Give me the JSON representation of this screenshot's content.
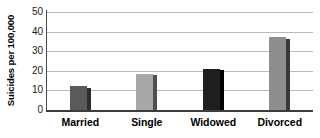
{
  "chart_data": {
    "type": "bar",
    "title": "",
    "xlabel": "",
    "ylabel": "Suicides per 100,000",
    "categories": [
      "Married",
      "Single",
      "Widowed",
      "Divorced"
    ],
    "values": [
      12,
      18.5,
      21,
      37
    ],
    "ylim": [
      0,
      50
    ],
    "ytick_labels": [
      "0",
      "10",
      "20",
      "30",
      "40",
      "50"
    ],
    "ytick_values": [
      0,
      10,
      20,
      30,
      40,
      50
    ],
    "grid": "horizontal",
    "legend": "none",
    "bar_colors": [
      "#5a5a5a",
      "#a8a8a8",
      "#1e1e1e",
      "#8e8e8e"
    ],
    "bar_side_colors": [
      "#2e2e2e",
      "#4f4f4f",
      "#000000",
      "#3a3a3a"
    ],
    "gridline_color": "#b9b9b9",
    "axis_color": "#3d3d3d"
  }
}
